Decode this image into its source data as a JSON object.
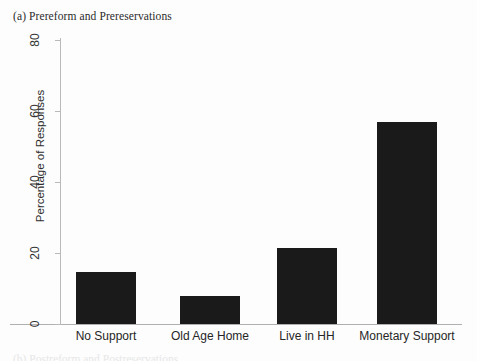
{
  "figure": {
    "panel_caption": "(a) Prereform and Prereservations",
    "bottom_caption_partial": "(b) Postreform and Postreservations"
  },
  "chart_data": {
    "type": "bar",
    "title": "(a) Prereform and Prereservations",
    "xlabel": "",
    "ylabel": "Percentage of Responses",
    "categories": [
      "No Support",
      "Old Age Home",
      "Live in HH",
      "Monetary Support"
    ],
    "values": [
      14.6,
      7.9,
      21.4,
      56.9
    ],
    "ylim": [
      0,
      80
    ],
    "yticks": [
      0,
      20,
      40,
      60,
      80
    ],
    "ytick_labels": [
      "0",
      "20",
      "40",
      "60",
      "80"
    ],
    "grid": false,
    "legend": false,
    "bar_color": "#1a1a1a",
    "axis_color": "#b0b0b0"
  },
  "axis": {
    "y_title": "Percentage of Responses",
    "y_ticks": [
      {
        "label": "80",
        "value": 80
      },
      {
        "label": "60",
        "value": 60
      },
      {
        "label": "40",
        "value": 40
      },
      {
        "label": "20",
        "value": 20
      },
      {
        "label": "0",
        "value": 0
      }
    ]
  },
  "bars": [
    {
      "label": "No Support",
      "value": 14.6
    },
    {
      "label": "Old Age Home",
      "value": 7.9
    },
    {
      "label": "Live in HH",
      "value": 21.4
    },
    {
      "label": "Monetary Support",
      "value": 56.9
    }
  ]
}
